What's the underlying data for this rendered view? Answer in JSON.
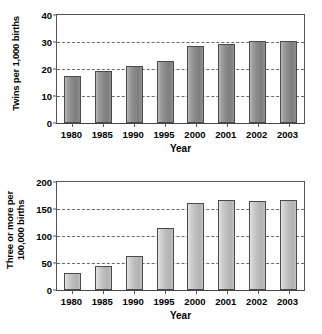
{
  "chart_data": [
    {
      "id": "twins",
      "type": "bar",
      "title": "",
      "xlabel": "Year",
      "ylabel": "Twins per 1,000 births",
      "ylabel_lines": [
        "Twins per 1,000 births"
      ],
      "categories": [
        "1980",
        "1985",
        "1990",
        "1995",
        "2000",
        "2001",
        "2002",
        "2003"
      ],
      "values": [
        17.5,
        19.3,
        21.0,
        22.8,
        28.7,
        29.4,
        30.3,
        30.4
      ],
      "ylim": [
        0,
        40
      ],
      "yticks": [
        0,
        10,
        20,
        30,
        40
      ],
      "ytick_labels": [
        "0",
        "10",
        "20",
        "30",
        "40"
      ],
      "gridlines": [
        10,
        20,
        30
      ],
      "grid": true,
      "grid_style": "dashed",
      "legend": "none",
      "bar_color": "#8a8a8a",
      "bar_edge_color": "#4a4a4a"
    },
    {
      "id": "three-or-more",
      "type": "bar",
      "title": "",
      "xlabel": "Year",
      "ylabel": "Three or more per 100,000 births",
      "ylabel_lines": [
        "Three or more per",
        "100,000 births"
      ],
      "categories": [
        "1980",
        "1985",
        "1990",
        "1995",
        "2000",
        "2001",
        "2002",
        "2003"
      ],
      "values": [
        32,
        45,
        63,
        114,
        161,
        167,
        165,
        167
      ],
      "ylim": [
        0,
        200
      ],
      "yticks": [
        0,
        50,
        100,
        150,
        200
      ],
      "ytick_labels": [
        "0",
        "50",
        "100",
        "150",
        "200"
      ],
      "gridlines": [
        50,
        100,
        150
      ],
      "grid": true,
      "grid_style": "dashed",
      "legend": "none",
      "bar_color": "#bdbdbd",
      "bar_edge_color": "#4a4a4a"
    }
  ]
}
